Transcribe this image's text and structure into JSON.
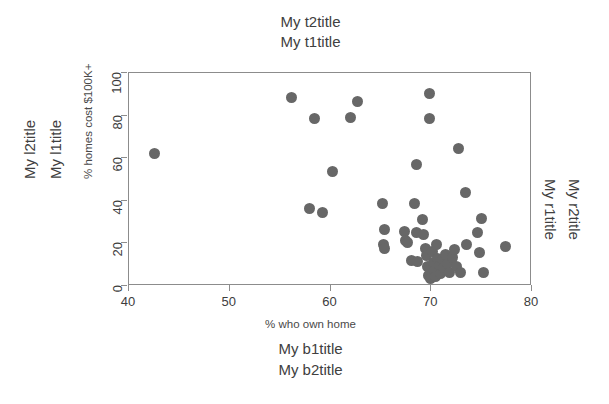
{
  "figure": {
    "background_color": "#ffffff",
    "point_color": "#676767",
    "axis_color": "#8c8c8c",
    "text_color": "#3d3d3d"
  },
  "margin_titles": {
    "top_outer": "My t2title",
    "top_inner": "My t1title",
    "bottom_inner": "My b1title",
    "bottom_outer": "My b2title",
    "left_outer": "My l2title",
    "left_inner": "My l1title",
    "right_inner": "My r1title",
    "right_outer": "My r2title"
  },
  "chart_data": {
    "type": "scatter",
    "title": "My t1title",
    "xlabel": "% who own home",
    "ylabel": "% homes cost $100K+",
    "xlim": [
      40,
      80
    ],
    "ylim": [
      0,
      100
    ],
    "xticks": [
      40,
      50,
      60,
      70,
      80
    ],
    "yticks": [
      0,
      20,
      40,
      60,
      80,
      100
    ],
    "xtick_labels": [
      "40",
      "50",
      "60",
      "70",
      "80"
    ],
    "ytick_labels": [
      "0",
      "20",
      "40",
      "60",
      "80",
      "100"
    ],
    "grid": false,
    "legend": null,
    "marker": "filled-circle",
    "marker_color": "#676767",
    "marker_size": 11,
    "n_points": 51,
    "points": [
      [
        42.5,
        62.0
      ],
      [
        56.1,
        88.5
      ],
      [
        57.9,
        36.5
      ],
      [
        58.4,
        78.5
      ],
      [
        59.2,
        34.5
      ],
      [
        60.2,
        53.8
      ],
      [
        62.0,
        79.0
      ],
      [
        62.7,
        86.5
      ],
      [
        65.2,
        38.5
      ],
      [
        65.4,
        26.5
      ],
      [
        65.3,
        19.5
      ],
      [
        65.4,
        17.5
      ],
      [
        67.3,
        25.5
      ],
      [
        67.4,
        21.5
      ],
      [
        67.6,
        20.5
      ],
      [
        68.0,
        12.0
      ],
      [
        68.3,
        38.5
      ],
      [
        68.5,
        57.0
      ],
      [
        68.5,
        25.0
      ],
      [
        68.6,
        11.5
      ],
      [
        69.1,
        31.0
      ],
      [
        69.2,
        24.0
      ],
      [
        69.4,
        17.5
      ],
      [
        69.5,
        14.5
      ],
      [
        69.6,
        9.0
      ],
      [
        69.7,
        5.0
      ],
      [
        69.8,
        90.5
      ],
      [
        69.8,
        78.5
      ],
      [
        69.9,
        3.5
      ],
      [
        70.1,
        16.0
      ],
      [
        70.2,
        11.0
      ],
      [
        70.3,
        7.5
      ],
      [
        70.4,
        4.5
      ],
      [
        70.5,
        19.5
      ],
      [
        70.6,
        13.0
      ],
      [
        70.8,
        9.5
      ],
      [
        70.9,
        6.0
      ],
      [
        71.1,
        12.5
      ],
      [
        71.2,
        8.5
      ],
      [
        71.4,
        15.0
      ],
      [
        71.6,
        10.5
      ],
      [
        71.8,
        6.5
      ],
      [
        72.1,
        13.5
      ],
      [
        72.3,
        17.0
      ],
      [
        72.5,
        9.0
      ],
      [
        72.7,
        64.5
      ],
      [
        72.9,
        6.5
      ],
      [
        73.4,
        44.0
      ],
      [
        73.5,
        19.5
      ],
      [
        74.6,
        25.0
      ],
      [
        74.8,
        15.5
      ],
      [
        75.0,
        31.5
      ],
      [
        75.2,
        6.5
      ],
      [
        77.4,
        18.5
      ]
    ]
  }
}
